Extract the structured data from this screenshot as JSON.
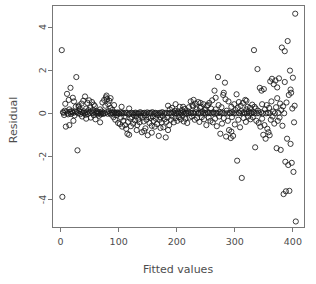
{
  "chart_data": {
    "type": "scatter",
    "title": "",
    "subtitle": "",
    "xlabel": "Fitted values",
    "ylabel": "Residual",
    "xlim": [
      -14,
      420
    ],
    "ylim": [
      -5.3,
      5.0
    ],
    "xticks": [
      0,
      100,
      200,
      300,
      400
    ],
    "xtick_labels": [
      "0",
      "100",
      "200",
      "300",
      "400"
    ],
    "yticks": [
      -4,
      -2,
      0,
      2,
      4
    ],
    "ytick_labels": [
      "-4",
      "-2",
      "0",
      "2",
      "4"
    ],
    "grid": false,
    "legend": null,
    "marker": "open-circle",
    "marker_color": "#1a1a1a",
    "marker_radius_px": 2.6,
    "n_points": 402,
    "points": [
      [
        2,
        2.93
      ],
      [
        3,
        -3.88
      ],
      [
        4,
        0.05
      ],
      [
        5,
        0.02
      ],
      [
        6,
        -0.08
      ],
      [
        7,
        0.12
      ],
      [
        8,
        0.44
      ],
      [
        9,
        -0.62
      ],
      [
        10,
        0.08
      ],
      [
        11,
        0.9
      ],
      [
        12,
        0.0
      ],
      [
        13,
        -0.05
      ],
      [
        14,
        0.62
      ],
      [
        15,
        0.18
      ],
      [
        16,
        0.07
      ],
      [
        17,
        1.18
      ],
      [
        18,
        -0.03
      ],
      [
        19,
        0.1
      ],
      [
        20,
        0.05
      ],
      [
        21,
        0.72
      ],
      [
        22,
        0.02
      ],
      [
        23,
        0.55
      ],
      [
        24,
        -0.1
      ],
      [
        25,
        0.08
      ],
      [
        26,
        0.3
      ],
      [
        27,
        1.68
      ],
      [
        28,
        0.05
      ],
      [
        29,
        -1.72
      ],
      [
        30,
        0.0
      ],
      [
        31,
        0.36
      ],
      [
        32,
        0.11
      ],
      [
        33,
        0.2
      ],
      [
        34,
        -0.04
      ],
      [
        35,
        0.06
      ],
      [
        36,
        0.45
      ],
      [
        37,
        -0.15
      ],
      [
        38,
        0.02
      ],
      [
        39,
        0.58
      ],
      [
        40,
        0.09
      ],
      [
        41,
        0.0
      ],
      [
        42,
        0.78
      ],
      [
        43,
        -0.07
      ],
      [
        44,
        0.22
      ],
      [
        45,
        0.05
      ],
      [
        46,
        0.48
      ],
      [
        47,
        -0.03
      ],
      [
        48,
        0.14
      ],
      [
        49,
        0.6
      ],
      [
        50,
        0.03
      ],
      [
        51,
        0.26
      ],
      [
        52,
        -0.2
      ],
      [
        53,
        0.08
      ],
      [
        54,
        0.52
      ],
      [
        55,
        0.0
      ],
      [
        56,
        0.16
      ],
      [
        57,
        -0.09
      ],
      [
        58,
        0.05
      ],
      [
        59,
        0.33
      ],
      [
        60,
        -0.28
      ],
      [
        61,
        0.02
      ],
      [
        62,
        0.1
      ],
      [
        63,
        -0.02
      ],
      [
        64,
        0.07
      ],
      [
        65,
        0.0
      ],
      [
        66,
        -0.12
      ],
      [
        67,
        0.04
      ],
      [
        68,
        0.18
      ],
      [
        69,
        -0.05
      ],
      [
        70,
        0.0
      ],
      [
        71,
        0.08
      ],
      [
        72,
        0.5
      ],
      [
        73,
        -0.03
      ],
      [
        74,
        0.02
      ],
      [
        75,
        0.62
      ],
      [
        76,
        0.0
      ],
      [
        77,
        0.35
      ],
      [
        78,
        0.74
      ],
      [
        79,
        0.05
      ],
      [
        80,
        0.66
      ],
      [
        81,
        -0.02
      ],
      [
        82,
        0.42
      ],
      [
        83,
        0.1
      ],
      [
        84,
        0.58
      ],
      [
        85,
        0.0
      ],
      [
        86,
        0.25
      ],
      [
        87,
        -0.06
      ],
      [
        88,
        0.03
      ],
      [
        89,
        0.15
      ],
      [
        90,
        0.0
      ],
      [
        91,
        -0.18
      ],
      [
        92,
        0.05
      ],
      [
        93,
        0.0
      ],
      [
        94,
        -0.3
      ],
      [
        95,
        0.02
      ],
      [
        96,
        -0.08
      ],
      [
        97,
        0.0
      ],
      [
        98,
        0.04
      ],
      [
        99,
        -0.45
      ],
      [
        100,
        0.0
      ],
      [
        101,
        -0.02
      ],
      [
        102,
        -0.5
      ],
      [
        103,
        0.05
      ],
      [
        104,
        -0.2
      ],
      [
        105,
        0.0
      ],
      [
        106,
        -0.62
      ],
      [
        107,
        0.03
      ],
      [
        108,
        -0.35
      ],
      [
        109,
        0.0
      ],
      [
        110,
        -0.15
      ],
      [
        111,
        -0.55
      ],
      [
        112,
        0.02
      ],
      [
        113,
        -0.72
      ],
      [
        114,
        0.0
      ],
      [
        115,
        -0.95
      ],
      [
        116,
        -0.4
      ],
      [
        117,
        -0.05
      ],
      [
        118,
        -1.0
      ],
      [
        119,
        0.0
      ],
      [
        120,
        -0.25
      ],
      [
        121,
        -0.6
      ],
      [
        122,
        0.02
      ],
      [
        123,
        -0.18
      ],
      [
        124,
        0.0
      ],
      [
        125,
        -0.48
      ],
      [
        126,
        -0.08
      ],
      [
        127,
        0.0
      ],
      [
        128,
        -0.33
      ],
      [
        129,
        0.03
      ],
      [
        130,
        -0.15
      ],
      [
        131,
        0.0
      ],
      [
        132,
        -0.55
      ],
      [
        133,
        -0.02
      ],
      [
        134,
        -0.28
      ],
      [
        135,
        0.0
      ],
      [
        136,
        -0.42
      ],
      [
        137,
        0.05
      ],
      [
        138,
        -0.12
      ],
      [
        139,
        0.0
      ],
      [
        140,
        -0.88
      ],
      [
        141,
        -0.2
      ],
      [
        142,
        0.0
      ],
      [
        143,
        -0.38
      ],
      [
        144,
        0.02
      ],
      [
        145,
        -0.1
      ],
      [
        146,
        -0.7
      ],
      [
        147,
        0.0
      ],
      [
        148,
        -0.3
      ],
      [
        149,
        0.04
      ],
      [
        150,
        -1.02
      ],
      [
        151,
        -0.18
      ],
      [
        152,
        0.0
      ],
      [
        153,
        -0.45
      ],
      [
        154,
        0.02
      ],
      [
        155,
        -0.22
      ],
      [
        156,
        0.0
      ],
      [
        157,
        -0.58
      ],
      [
        158,
        0.05
      ],
      [
        159,
        -0.15
      ],
      [
        160,
        -0.35
      ],
      [
        161,
        0.0
      ],
      [
        162,
        -0.62
      ],
      [
        163,
        0.02
      ],
      [
        164,
        -0.25
      ],
      [
        165,
        0.0
      ],
      [
        166,
        -0.5
      ],
      [
        167,
        -0.08
      ],
      [
        168,
        0.0
      ],
      [
        169,
        -1.05
      ],
      [
        170,
        -0.3
      ],
      [
        171,
        0.02
      ],
      [
        172,
        -0.18
      ],
      [
        173,
        0.0
      ],
      [
        174,
        -0.42
      ],
      [
        175,
        0.05
      ],
      [
        176,
        -0.12
      ],
      [
        177,
        -0.65
      ],
      [
        178,
        0.0
      ],
      [
        179,
        -0.28
      ],
      [
        180,
        0.02
      ],
      [
        181,
        -1.12
      ],
      [
        182,
        -0.4
      ],
      [
        183,
        0.0
      ],
      [
        184,
        -0.2
      ],
      [
        185,
        0.35
      ],
      [
        186,
        0.0
      ],
      [
        187,
        -0.55
      ],
      [
        188,
        0.18
      ],
      [
        189,
        0.02
      ],
      [
        190,
        -0.3
      ],
      [
        191,
        0.0
      ],
      [
        192,
        0.25
      ],
      [
        193,
        -0.15
      ],
      [
        194,
        0.05
      ],
      [
        195,
        -0.42
      ],
      [
        196,
        0.0
      ],
      [
        197,
        0.12
      ],
      [
        198,
        -0.22
      ],
      [
        199,
        0.02
      ],
      [
        200,
        0.0
      ],
      [
        201,
        -0.35
      ],
      [
        202,
        0.08
      ],
      [
        203,
        0.0
      ],
      [
        204,
        -0.18
      ],
      [
        205,
        0.3
      ],
      [
        206,
        0.02
      ],
      [
        207,
        -0.28
      ],
      [
        208,
        0.0
      ],
      [
        209,
        0.15
      ],
      [
        210,
        -0.12
      ],
      [
        211,
        0.05
      ],
      [
        212,
        -0.38
      ],
      [
        213,
        0.0
      ],
      [
        214,
        0.2
      ],
      [
        215,
        -0.25
      ],
      [
        216,
        0.02
      ],
      [
        217,
        0.0
      ],
      [
        218,
        -0.45
      ],
      [
        219,
        0.1
      ],
      [
        220,
        0.0
      ],
      [
        221,
        0.28
      ],
      [
        222,
        -0.2
      ],
      [
        223,
        0.03
      ],
      [
        224,
        0.55
      ],
      [
        225,
        0.0
      ],
      [
        226,
        -0.15
      ],
      [
        227,
        0.38
      ],
      [
        228,
        0.02
      ],
      [
        229,
        0.62
      ],
      [
        230,
        0.0
      ],
      [
        231,
        -0.3
      ],
      [
        232,
        0.45
      ],
      [
        233,
        0.05
      ],
      [
        234,
        0.18
      ],
      [
        235,
        -0.22
      ],
      [
        236,
        0.0
      ],
      [
        237,
        0.52
      ],
      [
        238,
        0.02
      ],
      [
        239,
        -0.4
      ],
      [
        240,
        0.25
      ],
      [
        241,
        0.0
      ],
      [
        242,
        0.3
      ],
      [
        243,
        -0.18
      ],
      [
        244,
        0.08
      ],
      [
        245,
        0.0
      ],
      [
        246,
        0.42
      ],
      [
        247,
        -0.28
      ],
      [
        248,
        0.02
      ],
      [
        249,
        0.15
      ],
      [
        250,
        0.0
      ],
      [
        251,
        -0.55
      ],
      [
        252,
        0.35
      ],
      [
        253,
        0.05
      ],
      [
        254,
        0.0
      ],
      [
        255,
        -0.2
      ],
      [
        256,
        0.48
      ],
      [
        257,
        0.02
      ],
      [
        258,
        -0.35
      ],
      [
        259,
        0.22
      ],
      [
        260,
        0.0
      ],
      [
        261,
        0.6
      ],
      [
        262,
        -0.42
      ],
      [
        263,
        0.05
      ],
      [
        264,
        0.0
      ],
      [
        265,
        1.05
      ],
      [
        266,
        -0.25
      ],
      [
        267,
        0.18
      ],
      [
        268,
        0.02
      ],
      [
        269,
        -0.6
      ],
      [
        270,
        0.0
      ],
      [
        271,
        1.68
      ],
      [
        272,
        0.38
      ],
      [
        273,
        -0.15
      ],
      [
        274,
        0.05
      ],
      [
        275,
        -0.95
      ],
      [
        276,
        0.0
      ],
      [
        277,
        0.28
      ],
      [
        278,
        -0.48
      ],
      [
        279,
        0.02
      ],
      [
        280,
        0.85
      ],
      [
        281,
        -0.22
      ],
      [
        282,
        0.0
      ],
      [
        283,
        1.42
      ],
      [
        284,
        0.65
      ],
      [
        285,
        -1.08
      ],
      [
        286,
        0.12
      ],
      [
        287,
        0.0
      ],
      [
        288,
        -0.35
      ],
      [
        289,
        0.55
      ],
      [
        290,
        -0.78
      ],
      [
        291,
        0.02
      ],
      [
        292,
        0.0
      ],
      [
        293,
        -1.15
      ],
      [
        294,
        0.3
      ],
      [
        295,
        -0.18
      ],
      [
        296,
        0.05
      ],
      [
        297,
        -1.05
      ],
      [
        298,
        0.0
      ],
      [
        299,
        0.42
      ],
      [
        300,
        -0.52
      ],
      [
        301,
        0.15
      ],
      [
        302,
        0.0
      ],
      [
        303,
        0.88
      ],
      [
        304,
        -2.2
      ],
      [
        305,
        0.25
      ],
      [
        306,
        -0.3
      ],
      [
        307,
        0.02
      ],
      [
        308,
        0.0
      ],
      [
        309,
        -0.65
      ],
      [
        310,
        0.35
      ],
      [
        311,
        0.1
      ],
      [
        312,
        -3.0
      ],
      [
        313,
        0.0
      ],
      [
        314,
        0.48
      ],
      [
        315,
        -0.22
      ],
      [
        316,
        0.05
      ],
      [
        317,
        0.0
      ],
      [
        318,
        0.62
      ],
      [
        319,
        -0.4
      ],
      [
        320,
        0.18
      ],
      [
        321,
        0.0
      ],
      [
        322,
        0.3
      ],
      [
        323,
        -0.15
      ],
      [
        324,
        0.08
      ],
      [
        325,
        0.0
      ],
      [
        326,
        0.25
      ],
      [
        327,
        -0.28
      ],
      [
        328,
        0.02
      ],
      [
        329,
        0.0
      ],
      [
        330,
        0.4
      ],
      [
        331,
        -0.18
      ],
      [
        332,
        0.05
      ],
      [
        333,
        2.93
      ],
      [
        334,
        0.0
      ],
      [
        335,
        -1.58
      ],
      [
        336,
        0.22
      ],
      [
        337,
        -0.35
      ],
      [
        338,
        0.0
      ],
      [
        339,
        2.05
      ],
      [
        340,
        0.12
      ],
      [
        341,
        -0.45
      ],
      [
        342,
        0.0
      ],
      [
        343,
        1.18
      ],
      [
        344,
        -0.62
      ],
      [
        345,
        0.05
      ],
      [
        346,
        1.05
      ],
      [
        347,
        -0.25
      ],
      [
        348,
        0.0
      ],
      [
        349,
        -1.0
      ],
      [
        350,
        1.12
      ],
      [
        351,
        -0.55
      ],
      [
        352,
        0.18
      ],
      [
        353,
        -1.18
      ],
      [
        354,
        0.0
      ],
      [
        355,
        0.38
      ],
      [
        356,
        -0.72
      ],
      [
        357,
        0.02
      ],
      [
        358,
        -0.88
      ],
      [
        359,
        0.25
      ],
      [
        360,
        0.0
      ],
      [
        361,
        1.48
      ],
      [
        362,
        -0.3
      ],
      [
        363,
        0.55
      ],
      [
        364,
        1.6
      ],
      [
        365,
        -0.15
      ],
      [
        366,
        0.08
      ],
      [
        367,
        1.35
      ],
      [
        368,
        -0.48
      ],
      [
        369,
        0.0
      ],
      [
        370,
        1.52
      ],
      [
        371,
        0.28
      ],
      [
        372,
        -1.62
      ],
      [
        373,
        0.7
      ],
      [
        374,
        -0.35
      ],
      [
        375,
        0.02
      ],
      [
        376,
        1.62
      ],
      [
        377,
        -0.2
      ],
      [
        378,
        0.45
      ],
      [
        379,
        -1.7
      ],
      [
        380,
        0.15
      ],
      [
        381,
        3.05
      ],
      [
        382,
        -0.58
      ],
      [
        383,
        0.32
      ],
      [
        384,
        -3.75
      ],
      [
        385,
        0.0
      ],
      [
        386,
        2.88
      ],
      [
        387,
        -2.25
      ],
      [
        388,
        -3.62
      ],
      [
        389,
        0.5
      ],
      [
        390,
        -1.18
      ],
      [
        391,
        3.35
      ],
      [
        392,
        -2.4
      ],
      [
        393,
        0.85
      ],
      [
        394,
        -3.6
      ],
      [
        395,
        1.98
      ],
      [
        396,
        -1.42
      ],
      [
        397,
        0.95
      ],
      [
        398,
        -2.3
      ],
      [
        399,
        0.22
      ],
      [
        400,
        1.65
      ],
      [
        401,
        -2.72
      ],
      [
        402,
        -0.42
      ],
      [
        404,
        4.62
      ],
      [
        405,
        -5.02
      ],
      [
        15,
        -0.55
      ],
      [
        22,
        -0.35
      ],
      [
        31,
        0.3
      ],
      [
        44,
        -0.25
      ],
      [
        57,
        0.4
      ],
      [
        68,
        -0.42
      ],
      [
        79,
        0.82
      ],
      [
        86,
        0.7
      ],
      [
        92,
        0.38
      ],
      [
        105,
        0.3
      ],
      [
        118,
        0.22
      ],
      [
        131,
        -0.78
      ],
      [
        144,
        -0.82
      ],
      [
        157,
        -0.9
      ],
      [
        172,
        -0.68
      ],
      [
        185,
        -0.78
      ],
      [
        198,
        0.42
      ],
      [
        211,
        0.3
      ],
      [
        228,
        0.32
      ],
      [
        241,
        0.48
      ],
      [
        254,
        0.38
      ],
      [
        267,
        0.72
      ],
      [
        281,
        0.95
      ],
      [
        294,
        -0.85
      ],
      [
        307,
        0.52
      ],
      [
        320,
        0.58
      ],
      [
        334,
        0.3
      ],
      [
        347,
        0.42
      ],
      [
        360,
        -1.02
      ],
      [
        373,
        1.2
      ],
      [
        386,
        1.45
      ],
      [
        396,
        1.1
      ],
      [
        403,
        0.35
      ]
    ]
  },
  "axes": {
    "y_label": "Residual",
    "x_label": "Fitted values"
  }
}
